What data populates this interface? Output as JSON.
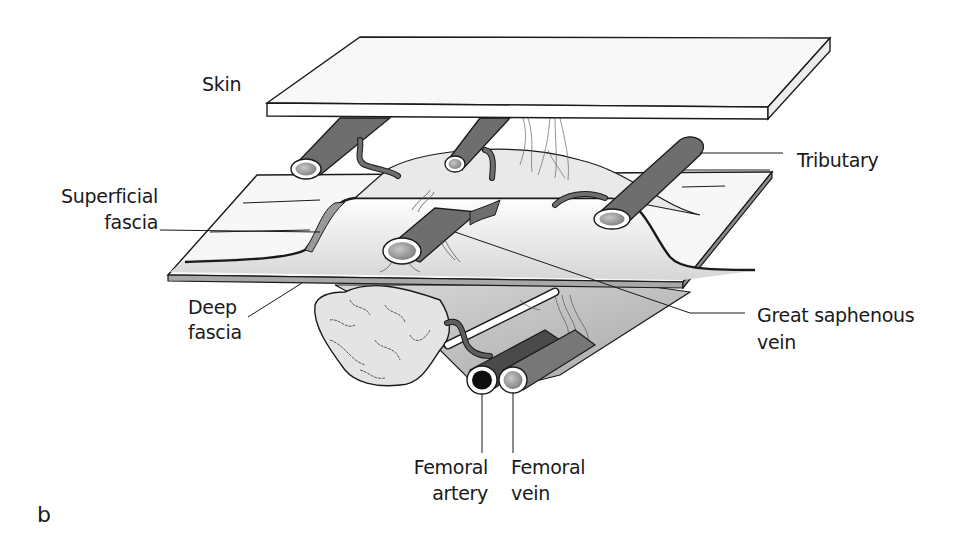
{
  "figure": {
    "panel_letter": "b"
  },
  "labels": {
    "skin": "Skin",
    "tributary": "Tributary",
    "superficial_fascia_line1": "Superficial",
    "superficial_fascia_line2": "fascia",
    "deep_fascia_line1": "Deep",
    "deep_fascia_line2": "fascia",
    "great_saphenous_line1": "Great saphenous",
    "great_saphenous_line2": "vein",
    "femoral_artery_line1": "Femoral",
    "femoral_artery_line2": "artery",
    "femoral_vein_line1": "Femoral",
    "femoral_vein_line2": "vein"
  },
  "colors": {
    "outline": "#1a1a1a",
    "vein_fill": "#6e6e6e",
    "layer_fill": "#f6f6f6",
    "shadow_fill": "#bdbdbd",
    "artery_lumen": "#0d0d0d"
  }
}
